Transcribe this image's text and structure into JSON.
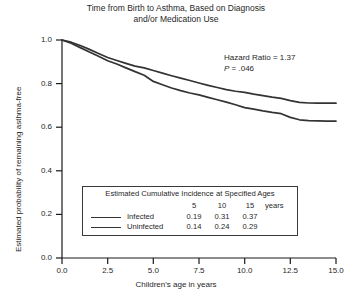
{
  "chart_data": {
    "type": "line",
    "title": "Time from Birth to Asthma, Based on Diagnosis and/or Medication Use",
    "title_line1": "Time from Birth to Asthma, Based on Diagnosis",
    "title_line2": "and/or Medication Use",
    "xlabel": "Children's age in years",
    "ylabel": "Estimated probability of remaining asthma-free",
    "xlim": [
      0.0,
      15.0
    ],
    "ylim": [
      0.0,
      1.0
    ],
    "xticks": [
      "0.0",
      "2.5",
      "5.0",
      "7.5",
      "10.0",
      "12.5",
      "15.0"
    ],
    "yticks": [
      "0.0",
      "0.2",
      "0.4",
      "0.6",
      "0.8",
      "1.0"
    ],
    "grid": false,
    "legend_position": "inset-box-lower-center",
    "series": [
      {
        "name": "Infected",
        "x": [
          0.0,
          0.5,
          1.0,
          1.5,
          2.0,
          2.5,
          3.0,
          3.5,
          4.0,
          4.5,
          5.0,
          5.5,
          6.0,
          6.5,
          7.0,
          7.5,
          8.0,
          8.5,
          9.0,
          9.5,
          10.0,
          10.5,
          11.0,
          11.5,
          12.0,
          12.5,
          13.0,
          13.5,
          14.0,
          14.5,
          15.0
        ],
        "values": [
          1.0,
          0.985,
          0.965,
          0.945,
          0.925,
          0.905,
          0.89,
          0.872,
          0.855,
          0.838,
          0.81,
          0.795,
          0.78,
          0.768,
          0.757,
          0.748,
          0.737,
          0.726,
          0.715,
          0.703,
          0.69,
          0.683,
          0.675,
          0.668,
          0.662,
          0.645,
          0.634,
          0.63,
          0.629,
          0.628,
          0.628
        ]
      },
      {
        "name": "Uninfected",
        "x": [
          0.0,
          0.5,
          1.0,
          1.5,
          2.0,
          2.5,
          3.0,
          3.5,
          4.0,
          4.5,
          5.0,
          5.5,
          6.0,
          6.5,
          7.0,
          7.5,
          8.0,
          8.5,
          9.0,
          9.5,
          10.0,
          10.5,
          11.0,
          11.5,
          12.0,
          12.5,
          13.0,
          13.5,
          14.0,
          14.5,
          15.0
        ],
        "values": [
          1.0,
          0.99,
          0.975,
          0.957,
          0.938,
          0.92,
          0.906,
          0.893,
          0.88,
          0.872,
          0.86,
          0.848,
          0.836,
          0.825,
          0.814,
          0.803,
          0.792,
          0.782,
          0.772,
          0.765,
          0.76,
          0.752,
          0.745,
          0.738,
          0.732,
          0.722,
          0.714,
          0.711,
          0.71,
          0.71,
          0.71
        ]
      }
    ],
    "annotations": {
      "hazard_ratio": "Hazard Ratio = 1.37",
      "p_symbol": "P",
      "p_value": " = .046"
    },
    "inset_table": {
      "title": "Estimated Cumulative Incidence at Specified Ages",
      "header": [
        "5",
        "10",
        "15"
      ],
      "header_unit": "years",
      "rows": [
        {
          "label": "Infected",
          "values": [
            "0.19",
            "0.31",
            "0.37"
          ]
        },
        {
          "label": "Uninfected",
          "values": [
            "0.14",
            "0.24",
            "0.29"
          ]
        }
      ]
    },
    "colors": {
      "line": "#333333",
      "axis": "#1a1a1a",
      "background": "#ffffff"
    }
  }
}
